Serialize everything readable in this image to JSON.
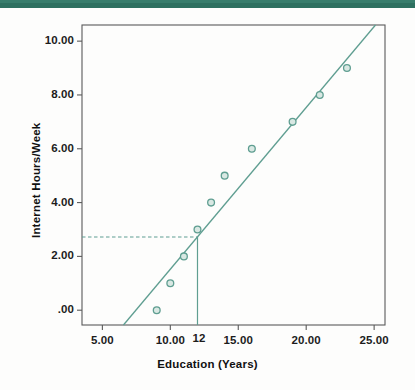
{
  "figure": {
    "background_color": "#ffffff",
    "band_color": "#2e7060",
    "series_color": "#5f9e91",
    "frame_color": "#5a5a5a"
  },
  "chart_data": {
    "type": "scatter",
    "title": "",
    "xlabel": "Education (Years)",
    "ylabel": "Internet Hours/Week",
    "xlim": [
      3.5,
      25.8
    ],
    "ylim": [
      -0.55,
      10.6
    ],
    "xticks": [
      5,
      10,
      15,
      20,
      25
    ],
    "xtick_labels": [
      "5.00",
      "10.00",
      "15.00",
      "20.00",
      "25.00"
    ],
    "yticks": [
      0,
      2,
      4,
      6,
      8,
      10
    ],
    "ytick_labels": [
      ".00",
      "2.00",
      "4.00",
      "6.00",
      "8.00",
      "10.00"
    ],
    "grid": false,
    "legend": "none",
    "x": [
      9,
      10,
      11,
      12,
      13,
      14,
      16,
      19,
      21,
      23
    ],
    "y": [
      0.0,
      1.0,
      2.0,
      3.0,
      4.0,
      5.0,
      6.0,
      7.0,
      8.0,
      9.0
    ],
    "points": [
      {
        "x": 9,
        "y": 0.0
      },
      {
        "x": 10,
        "y": 1.0
      },
      {
        "x": 11,
        "y": 2.0
      },
      {
        "x": 12,
        "y": 3.0
      },
      {
        "x": 13,
        "y": 4.0
      },
      {
        "x": 14,
        "y": 5.0
      },
      {
        "x": 16,
        "y": 6.0
      },
      {
        "x": 19,
        "y": 7.0
      },
      {
        "x": 21,
        "y": 8.0
      },
      {
        "x": 23,
        "y": 9.0
      }
    ],
    "fit_line": {
      "label": "regression line",
      "x_start": 6.55,
      "y_start": -0.55,
      "x_end": 25.1,
      "y_end": 10.6,
      "slope": 0.601,
      "intercept": -4.49
    },
    "annotations": [
      {
        "name": "prediction-marker",
        "x_value": 12,
        "y_value": 2.72,
        "x_label": "12",
        "style": "dashed horizontal to solid vertical drop line"
      }
    ]
  },
  "axis_titles": {
    "x": "Education (Years)",
    "y": "Internet Hours/Week"
  }
}
